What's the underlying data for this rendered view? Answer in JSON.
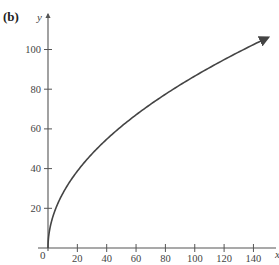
{
  "header": {
    "prev_panel_label": "(a)",
    "prev_panel_text": "x ≥ 0",
    "panel_label": "(b)"
  },
  "chart_data": {
    "type": "line",
    "title": "",
    "xlabel": "x",
    "ylabel": "y",
    "xlim": [
      0,
      150
    ],
    "ylim": [
      0,
      110
    ],
    "x_ticks": [
      20,
      40,
      60,
      80,
      100,
      120,
      140
    ],
    "x_tick_labels": [
      "20",
      "40",
      "60",
      "80",
      "100",
      "120",
      "140"
    ],
    "y_ticks": [
      20,
      40,
      60,
      80,
      100
    ],
    "y_tick_labels": [
      "20",
      "40",
      "60",
      "80",
      "100"
    ],
    "origin_label": "0",
    "grid": false,
    "legend": null,
    "series": [
      {
        "name": "curve",
        "note": "y ≈ 8.66·√x, ends with arrowhead",
        "x": [
          0,
          5,
          10,
          20,
          40,
          60,
          80,
          100,
          120,
          140,
          150
        ],
        "y": [
          0,
          19.4,
          27.4,
          38.7,
          54.8,
          67.1,
          77.5,
          86.6,
          94.9,
          102.5,
          106.1
        ]
      }
    ],
    "colors": {
      "curve": "#444444",
      "axes": "#555555"
    }
  }
}
